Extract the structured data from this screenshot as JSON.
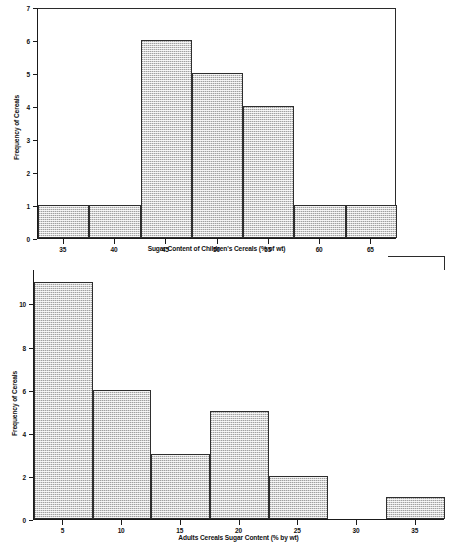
{
  "figure": {
    "background": "#ffffff",
    "bar_fill": "#d2d2d2",
    "bar_edge": "#2e2e2e",
    "axis_color": "#1a1a1a"
  },
  "chart_data": [
    {
      "id": "children-cereals-histogram",
      "type": "bar",
      "title": "",
      "xlabel": "Sugar Content of Children's Cereals (% of wt)",
      "ylabel": "Frequency of Cereals",
      "xtick_labels": [
        "35",
        "40",
        "45",
        "50",
        "55",
        "60",
        "65"
      ],
      "xtick_values": [
        35,
        40,
        45,
        50,
        55,
        60,
        65
      ],
      "ytick_labels": [
        "0",
        "1",
        "2",
        "3",
        "4",
        "5",
        "6",
        "7"
      ],
      "ytick_values": [
        0,
        1,
        2,
        3,
        4,
        5,
        6,
        7
      ],
      "xlim": [
        32.5,
        67.5
      ],
      "ylim": [
        0,
        7
      ],
      "bin_edges": [
        32.5,
        37.5,
        42.5,
        47.5,
        52.5,
        57.5,
        62.5,
        67.5
      ],
      "bin_labels": [
        "32.5-37.5",
        "37.5-42.5",
        "42.5-47.5",
        "47.5-52.5",
        "52.5-57.5",
        "57.5-62.5",
        "62.5-67.5"
      ],
      "values": [
        1,
        1,
        6,
        5,
        4,
        1,
        1
      ],
      "grid": false,
      "legend": false
    },
    {
      "id": "adults-cereals-histogram",
      "type": "bar",
      "title": "",
      "xlabel": "Adults Cereals Sugar Content (% by wt)",
      "ylabel": "Frequency of Cereals",
      "xtick_labels": [
        "5",
        "10",
        "15",
        "20",
        "25",
        "30",
        "35"
      ],
      "xtick_values": [
        5,
        10,
        15,
        20,
        25,
        30,
        35
      ],
      "ytick_labels": [
        "0",
        "2",
        "4",
        "6",
        "8",
        "10"
      ],
      "ytick_values": [
        0,
        2,
        4,
        6,
        8,
        10
      ],
      "xlim": [
        2.5,
        37.5
      ],
      "ylim": [
        0,
        11.6
      ],
      "bin_edges": [
        2.5,
        7.5,
        12.5,
        17.5,
        22.5,
        27.5,
        32.5,
        37.5
      ],
      "bin_labels": [
        "2.5-7.5",
        "7.5-12.5",
        "12.5-17.5",
        "17.5-22.5",
        "22.5-27.5",
        "27.5-32.5",
        "32.5-37.5"
      ],
      "values": [
        11,
        6,
        3,
        5,
        2,
        0,
        1
      ],
      "grid": false,
      "legend": false
    }
  ]
}
